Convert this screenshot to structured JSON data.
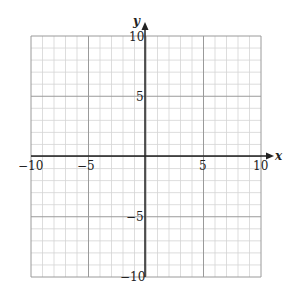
{
  "chart_data": {
    "type": "scatter",
    "title": "",
    "xlabel": "x",
    "ylabel": "y",
    "xlim": [
      -10,
      10
    ],
    "ylim": [
      -10,
      10
    ],
    "grid": true,
    "grid_step": 1,
    "major_step": 5,
    "x_ticks": [
      -10,
      -5,
      5,
      10
    ],
    "y_ticks": [
      10,
      5,
      -5,
      -10
    ],
    "series": []
  },
  "labels": {
    "x_axis": "x",
    "y_axis": "y",
    "x_tick_labels": [
      "−10",
      "−5",
      "5",
      "10"
    ],
    "y_tick_labels": [
      "10",
      "5",
      "−5",
      "−10"
    ]
  },
  "colors": {
    "minor_grid": "#d4d4d4",
    "major_grid": "#9a9a9a",
    "axis": "#222222"
  }
}
